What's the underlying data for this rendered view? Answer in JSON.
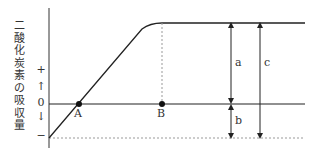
{
  "diagram": {
    "y_axis_label_chars": [
      "二",
      "酸",
      "化",
      "炭",
      "素",
      "の",
      "吸",
      "収",
      "量"
    ],
    "y_ticks": {
      "plus": "+",
      "up_arrow": "↑",
      "zero": "0",
      "down_arrow": "↓",
      "minus": "−"
    },
    "points": {
      "A": "A",
      "B": "B"
    },
    "brackets": {
      "a": "a",
      "b": "b",
      "c": "c"
    },
    "colors": {
      "line": "#222222",
      "dotted": "#999999"
    }
  }
}
